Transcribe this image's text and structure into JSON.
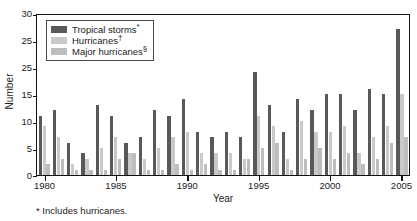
{
  "chart_data": {
    "type": "bar",
    "title": "",
    "xlabel": "Year",
    "ylabel": "Number",
    "ylim": [
      0,
      30
    ],
    "xlim": [
      1979.4,
      2005.6
    ],
    "grid": false,
    "legend_position": "top-left inside plot area",
    "ytick_labels": [
      "0",
      "5",
      "10",
      "15",
      "25",
      "25",
      "30"
    ],
    "ytick_values": [
      0,
      5,
      10,
      15,
      20,
      25,
      30
    ],
    "xtick_labels": [
      "1980",
      "1985",
      "1990",
      "1995",
      "2000",
      "2005"
    ],
    "xtick_values": [
      1980,
      1985,
      1990,
      1995,
      2000,
      2005
    ],
    "categories": [
      1980,
      1981,
      1982,
      1983,
      1984,
      1985,
      1986,
      1987,
      1988,
      1989,
      1990,
      1991,
      1992,
      1993,
      1994,
      1995,
      1996,
      1997,
      1998,
      1999,
      2000,
      2001,
      2002,
      2003,
      2004,
      2005
    ],
    "series": [
      {
        "name": "Tropical storms*",
        "key": "tropical_storms",
        "color": "#595959",
        "values": [
          11,
          12,
          6,
          4,
          13,
          11,
          6,
          7,
          12,
          11,
          14,
          8,
          7,
          8,
          7,
          19,
          13,
          8,
          14,
          12,
          15,
          15,
          12,
          16,
          15,
          27
        ]
      },
      {
        "name": "Hurricanes†",
        "key": "hurricanes",
        "color": "#c9c9c9",
        "values": [
          9,
          7,
          2,
          3,
          5,
          7,
          4,
          3,
          5,
          7,
          8,
          4,
          4,
          4,
          3,
          11,
          9,
          3,
          10,
          8,
          8,
          9,
          4,
          7,
          9,
          15
        ]
      },
      {
        "name": "Major hurricanes§",
        "key": "major_hurricanes",
        "color": "#bdbdbd",
        "values": [
          2,
          3,
          1,
          1,
          1,
          3,
          4,
          1,
          1,
          2,
          1,
          2,
          1,
          1,
          3,
          5,
          6,
          1,
          3,
          5,
          3,
          4,
          2,
          3,
          6,
          7
        ]
      }
    ],
    "footnotes": [
      "* Includes hurricanes."
    ]
  },
  "legend": {
    "items": [
      {
        "label": "Tropical storms",
        "marker": "*"
      },
      {
        "label": "Hurricanes",
        "marker": "†"
      },
      {
        "label": "Major hurricanes",
        "marker": "§"
      }
    ]
  },
  "axes": {
    "y_title": "Number",
    "x_title": "Year"
  },
  "footnote": "* Includes hurricanes."
}
